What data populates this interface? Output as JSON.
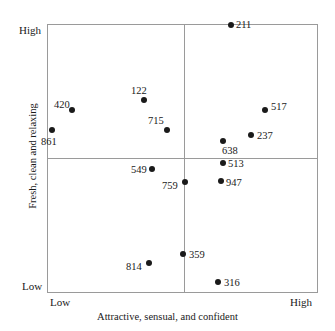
{
  "chart_data": {
    "type": "scatter",
    "title": "",
    "xlabel": "Attractive, sensual, and confident",
    "ylabel": "Fresh, clean and relaxing",
    "xlim": [
      0,
      1
    ],
    "ylim": [
      0,
      1
    ],
    "grid": false,
    "legend": false,
    "x_tick_labels": [
      "Low",
      "High"
    ],
    "y_tick_labels": [
      "Low",
      "High"
    ],
    "quadrant_divider_x": 0.505,
    "quadrant_divider_y": 0.502,
    "point_color": "#1a1a1a",
    "frame_color": "#9a9a9a",
    "background_color": "#ffffff",
    "points": [
      {
        "label": "211",
        "x": 0.679,
        "y": 0.996,
        "px": 231,
        "py": 25,
        "lx": 236,
        "ly": 19
      },
      {
        "label": "122",
        "x": 0.358,
        "y": 0.717,
        "px": 144,
        "py": 100,
        "lx": 131,
        "ly": 85
      },
      {
        "label": "420",
        "x": 0.092,
        "y": 0.68,
        "px": 72,
        "py": 110,
        "lx": 54,
        "ly": 99
      },
      {
        "label": "517",
        "x": 0.805,
        "y": 0.68,
        "px": 265,
        "py": 110,
        "lx": 271,
        "ly": 101
      },
      {
        "label": "715",
        "x": 0.443,
        "y": 0.606,
        "px": 167,
        "py": 130,
        "lx": 148,
        "ly": 115
      },
      {
        "label": "861",
        "x": 0.018,
        "y": 0.606,
        "px": 52,
        "py": 130,
        "lx": 41,
        "ly": 136
      },
      {
        "label": "237",
        "x": 0.753,
        "y": 0.587,
        "px": 251,
        "py": 135,
        "lx": 257,
        "ly": 130
      },
      {
        "label": "638",
        "x": 0.65,
        "y": 0.565,
        "px": 223,
        "py": 141,
        "lx": 222,
        "ly": 145
      },
      {
        "label": "513",
        "x": 0.65,
        "y": 0.483,
        "px": 223,
        "py": 163,
        "lx": 228,
        "ly": 158
      },
      {
        "label": "549",
        "x": 0.387,
        "y": 0.461,
        "px": 152,
        "py": 169,
        "lx": 131,
        "ly": 164
      },
      {
        "label": "947",
        "x": 0.643,
        "y": 0.416,
        "px": 221,
        "py": 181,
        "lx": 226,
        "ly": 177
      },
      {
        "label": "759",
        "x": 0.509,
        "y": 0.413,
        "px": 185,
        "py": 182,
        "lx": 162,
        "ly": 180
      },
      {
        "label": "359",
        "x": 0.502,
        "y": 0.145,
        "px": 183,
        "py": 254,
        "lx": 189,
        "ly": 249
      },
      {
        "label": "814",
        "x": 0.376,
        "y": 0.112,
        "px": 149,
        "py": 263,
        "lx": 126,
        "ly": 261
      },
      {
        "label": "316",
        "x": 0.631,
        "y": 0.041,
        "px": 218,
        "py": 282,
        "lx": 224,
        "ly": 277
      }
    ]
  }
}
